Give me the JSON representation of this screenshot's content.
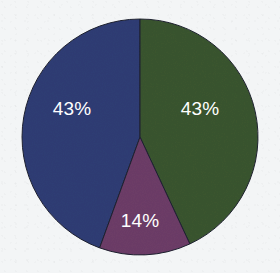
{
  "chart_data": {
    "type": "pie",
    "title": "",
    "subtitle": "",
    "xlabel": "",
    "ylabel": "",
    "legend_position": "none",
    "grid": false,
    "labels_shown": "percent",
    "categories": [
      "Segment 1",
      "Segment 2",
      "Segment 3"
    ],
    "values": [
      43,
      43,
      14
    ],
    "slices": [
      {
        "name": "blue-slice",
        "label": "43%",
        "value": 43,
        "color": "#2f3d75",
        "start_angle_deg": 200,
        "end_angle_deg": 360,
        "label_x": 72,
        "label_y": 110
      },
      {
        "name": "green-slice",
        "label": "43%",
        "value": 43,
        "color": "#3a5530",
        "start_angle_deg": 0,
        "end_angle_deg": 155,
        "label_x": 200,
        "label_y": 110
      },
      {
        "name": "purple-slice",
        "label": "14%",
        "value": 14,
        "color": "#6d3d68",
        "start_angle_deg": 155,
        "end_angle_deg": 200,
        "label_x": 140,
        "label_y": 222
      }
    ],
    "geometry": {
      "center_x": 140,
      "center_y": 137,
      "radius": 118
    },
    "colors": {
      "background": "#f3f5f6",
      "blue": "#2f3d75",
      "green": "#3a5530",
      "purple": "#6d3d68",
      "label_text": "#ffffff",
      "slice_outline": "#1d2030"
    }
  }
}
